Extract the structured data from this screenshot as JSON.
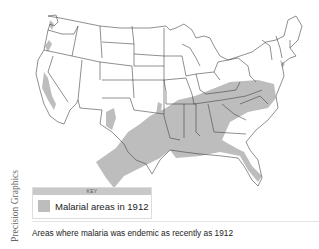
{
  "map": {
    "title": "Malaria endemic areas of the United States, 1912",
    "colors": {
      "shaded": "#bdbdbd",
      "outline": "#444444",
      "background": "#ffffff"
    }
  },
  "key": {
    "header": "KEY",
    "items": [
      {
        "label": "Malarial areas in 1912",
        "color": "#bdbdbd"
      }
    ]
  },
  "credit": "Precision Graphics",
  "caption": "Areas where malaria was endemic as recently as 1912"
}
